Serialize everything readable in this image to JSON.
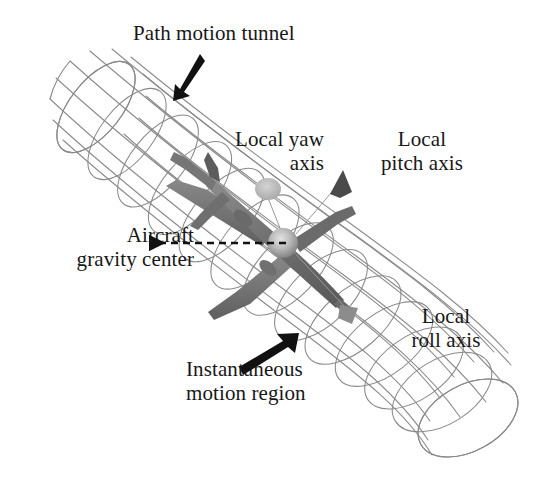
{
  "figure": {
    "kind": "technical-diagram",
    "background_color": "#ffffff"
  },
  "labels": {
    "path_motion_tunnel": "Path motion tunnel",
    "local_yaw_axis": "Local yaw\naxis",
    "local_pitch_axis": "Local\npitch axis",
    "aircraft_gravity_center": "Aircraft\ngravity center",
    "local_roll_axis": "Local\nroll axis",
    "instantaneous_motion_region": "Instantaneous\nmotion region"
  },
  "annotations": [
    {
      "name": "path-motion-tunnel-arrow",
      "style": "solid-thick",
      "color": "#111111",
      "from": [
        198,
        57
      ],
      "to": [
        177,
        97
      ],
      "points_to": "tunnel-wireframe-surface"
    },
    {
      "name": "aircraft-gravity-center-arrow",
      "style": "dashed",
      "color": "#111111",
      "from": [
        286,
        243
      ],
      "to": [
        147,
        243
      ],
      "points_to": "center-of-gravity-sphere"
    },
    {
      "name": "instantaneous-motion-region-arrow",
      "style": "solid-thick",
      "color": "#111111",
      "from": [
        245,
        372
      ],
      "to": [
        297,
        336
      ],
      "points_to": "tunnel-cross-section-ring"
    },
    {
      "name": "local-pitch-axis-leader",
      "style": "thin-line",
      "color": "#8e8e8e",
      "from": [
        300,
        225
      ],
      "to": [
        339,
        182
      ],
      "points_to": "pitch-axis-cone-marker"
    },
    {
      "name": "local-yaw-axis-leader",
      "style": "thin-line",
      "color": "#8e8e8e",
      "from": [
        288,
        238
      ],
      "to": [
        268,
        192
      ],
      "points_to": "yaw-axis-disc-marker"
    },
    {
      "name": "local-roll-axis-leader",
      "style": "thin-line",
      "color": "#8e8e8e",
      "from": [
        292,
        248
      ],
      "to": [
        346,
        310
      ],
      "points_to": "roll-axis-cone-marker"
    }
  ],
  "elements": {
    "tunnel": {
      "name": "path-motion-tunnel",
      "description": "Wireframe bent cylindrical tube running upper-left to lower-right",
      "wire_color": "#8a8a8a",
      "ring_count": 13,
      "longitudinal_count": 12,
      "axis_start": [
        95,
        105
      ],
      "axis_end": [
        452,
        418
      ]
    },
    "aircraft": {
      "name": "aircraft-model",
      "description": "Shaded gray airliner, fuselage from upper-left tail to lower-right nose",
      "body_color": "#767676",
      "highlight_color": "#9e9e9e",
      "center": [
        283,
        243
      ],
      "span_px": 150
    },
    "cg_sphere": {
      "name": "center-of-gravity-sphere",
      "color": "#b9b9b9",
      "center": [
        283,
        243
      ],
      "radius": 15
    },
    "yaw_marker": {
      "name": "yaw-axis-disc-marker",
      "color": "#b3b3b3",
      "center": [
        268,
        190
      ],
      "radius": 13
    },
    "pitch_marker": {
      "name": "pitch-axis-cone-marker",
      "color": "#4a4a4a",
      "center": [
        340,
        180
      ]
    },
    "roll_marker": {
      "name": "roll-axis-cone-marker",
      "color": "#8c8c8c",
      "center": [
        349,
        313
      ]
    }
  }
}
